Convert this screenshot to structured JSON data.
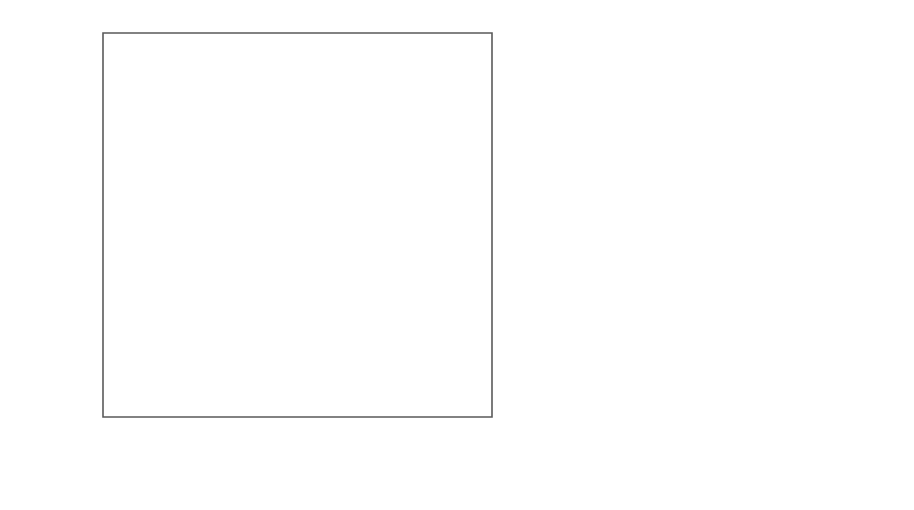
{
  "figure": {
    "width": 914,
    "height": 510,
    "background": "#ffffff"
  },
  "axes": {
    "xlabel": "log(Teff)",
    "xlabel_main": "log(T",
    "xlabel_sub": "eff",
    "xlabel_close": ")",
    "ylabel_main": "log(L/L",
    "ylabel_sub": "⊙",
    "ylabel_close": ")",
    "x_ticks": [
      "3.77",
      "3.76",
      "3.75"
    ],
    "x_tick_values": [
      3.77,
      3.76,
      3.75
    ],
    "y_ticks": [
      "0.2",
      "0.1",
      "0.0",
      "−0.1"
    ],
    "y_tick_values": [
      0.2,
      0.1,
      0.0,
      -0.1
    ],
    "xlim": [
      3.7735,
      3.7465
    ],
    "ylim": [
      -0.152,
      0.2615
    ],
    "x_minor_step": 0.001,
    "y_minor_step": 0.025,
    "grid": false,
    "direction": "x-reversed"
  },
  "panels": [
    {
      "id": "a",
      "tag": "(a)",
      "legend_header": "",
      "legend": [
        {
          "label": "1.40, 0.2667, 5.60",
          "mass": 1.4,
          "y_helium": 0.2667,
          "age": 5.6,
          "style": "solid",
          "color": "#1c1c1c",
          "width": 2.3
        },
        {
          "label": "1.60, 0.2500, 7.32",
          "mass": 1.6,
          "y_helium": 0.25,
          "age": 7.32,
          "style": "dashed",
          "color": "#1c1c1c",
          "width": 2.3
        },
        {
          "label": "1.80, 0.2341, 9.03",
          "mass": 1.8,
          "y_helium": 0.2341,
          "age": 9.03,
          "style": "solid",
          "color": "#9a9a9a",
          "width": 2.0
        },
        {
          "label": "2.00, 0.2198, 10.64",
          "mass": 2.0,
          "y_helium": 0.2198,
          "age": 10.64,
          "style": "dashed",
          "color": "#a8a8a8",
          "width": 2.0
        }
      ],
      "marker": {
        "type": "cross-with-errorbars",
        "x": 3.7642,
        "y": 0.2255
      }
    },
    {
      "id": "b",
      "tag": "(b)",
      "legend_header": "",
      "legend": [
        {
          "label": "1.6616, 0.245, 7.86",
          "mass": 1.6616,
          "y_helium": 0.245,
          "age": 7.86,
          "style": "solid",
          "color": "#1c1c1c",
          "width": 2.3
        },
        {
          "label": "1.4192, 0.265, 5.77",
          "mass": 1.4192,
          "y_helium": 0.265,
          "age": 5.77,
          "style": "dashed",
          "color": "#1c1c1c",
          "width": 2.3
        },
        {
          "label": "1.2036, 0.285, 3.90",
          "mass": 1.2036,
          "y_helium": 0.285,
          "age": 3.9,
          "style": "solid",
          "color": "#9a9a9a",
          "width": 2.0
        },
        {
          "label": "1.0054, 0.305, 2.27",
          "mass": 1.0054,
          "y_helium": 0.305,
          "age": 2.27,
          "style": "dashed",
          "color": "#a8a8a8",
          "width": 2.0
        }
      ],
      "marker": {
        "type": "cross-with-errorbars",
        "x": 3.7642,
        "y": 0.2255
      }
    }
  ],
  "chart_data": {
    "type": "line",
    "title": "",
    "xlabel": "log(Teff)",
    "ylabel": "log(L/Lsun)",
    "xlim": [
      3.7735,
      3.7465
    ],
    "ylim": [
      -0.152,
      0.2615
    ],
    "grid": false,
    "legend_position": "upper-right",
    "panels": [
      {
        "panel": "a",
        "tag": "(a)",
        "legend_format": "mass (Msun), Y (helium), age (Gyr)",
        "observed_point": {
          "log_Teff": 3.7642,
          "log_L": 0.2255,
          "err_log_Teff": 0.0016,
          "err_log_L": 0.009
        },
        "series": [
          {
            "name": "1.40, 0.2667, 5.60",
            "style": "solid",
            "color": "#1c1c1c",
            "points": [
              [
                3.7644,
                0.224
              ],
              [
                3.7646,
                0.218
              ],
              [
                3.7647,
                0.21
              ],
              [
                3.7646,
                0.2
              ],
              [
                3.7644,
                0.188
              ],
              [
                3.764,
                0.174
              ],
              [
                3.7634,
                0.16
              ],
              [
                3.7626,
                0.146
              ],
              [
                3.7616,
                0.132
              ],
              [
                3.7604,
                0.118
              ],
              [
                3.759,
                0.104
              ],
              [
                3.7574,
                0.09
              ],
              [
                3.7556,
                0.076
              ],
              [
                3.7538,
                0.063
              ],
              [
                3.752,
                0.051
              ],
              [
                3.7503,
                0.04
              ],
              [
                3.7487,
                0.03
              ],
              [
                3.7472,
                0.02
              ],
              [
                3.7461,
                0.011
              ],
              [
                3.7452,
                0.002
              ],
              [
                3.7446,
                -0.007
              ],
              [
                3.7443,
                -0.016
              ],
              [
                3.7442,
                -0.024
              ]
            ]
          },
          {
            "name": "1.60, 0.2500, 7.32",
            "style": "dashed",
            "color": "#1c1c1c",
            "points": [
              [
                3.7643,
                0.223
              ],
              [
                3.7645,
                0.216
              ],
              [
                3.7645,
                0.207
              ],
              [
                3.7643,
                0.196
              ],
              [
                3.7638,
                0.184
              ],
              [
                3.7631,
                0.17
              ],
              [
                3.7622,
                0.156
              ],
              [
                3.761,
                0.142
              ],
              [
                3.7596,
                0.128
              ],
              [
                3.758,
                0.114
              ],
              [
                3.7562,
                0.1
              ],
              [
                3.7542,
                0.086
              ],
              [
                3.7522,
                0.072
              ],
              [
                3.7501,
                0.059
              ],
              [
                3.7482,
                0.046
              ],
              [
                3.7473,
                0.033
              ],
              [
                3.7467,
                0.019
              ],
              [
                3.7462,
                0.005
              ],
              [
                3.7459,
                -0.009
              ],
              [
                3.7457,
                -0.023
              ],
              [
                3.7456,
                -0.037
              ],
              [
                3.7455,
                -0.05
              ],
              [
                3.7455,
                -0.063
              ]
            ]
          },
          {
            "name": "1.80, 0.2341, 9.03",
            "style": "solid",
            "color": "#9a9a9a",
            "points": [
              [
                3.7643,
                0.2225
              ],
              [
                3.7644,
                0.215
              ],
              [
                3.7643,
                0.205
              ],
              [
                3.764,
                0.193
              ],
              [
                3.7634,
                0.18
              ],
              [
                3.7626,
                0.166
              ],
              [
                3.7616,
                0.152
              ],
              [
                3.7603,
                0.138
              ],
              [
                3.7588,
                0.124
              ],
              [
                3.7571,
                0.11
              ],
              [
                3.7553,
                0.096
              ],
              [
                3.7534,
                0.082
              ],
              [
                3.7515,
                0.068
              ],
              [
                3.7497,
                0.054
              ],
              [
                3.7482,
                0.04
              ],
              [
                3.7471,
                0.026
              ],
              [
                3.7463,
                0.011
              ],
              [
                3.7457,
                -0.004
              ],
              [
                3.7453,
                -0.019
              ],
              [
                3.7451,
                -0.034
              ],
              [
                3.745,
                -0.049
              ],
              [
                3.745,
                -0.062
              ],
              [
                3.745,
                -0.0655
              ]
            ]
          },
          {
            "name": "2.00, 0.2198, 10.64",
            "style": "dashed",
            "color": "#a8a8a8",
            "points": [
              [
                3.7642,
                0.222
              ],
              [
                3.7643,
                0.214
              ],
              [
                3.7642,
                0.203
              ],
              [
                3.7638,
                0.19
              ],
              [
                3.7631,
                0.176
              ],
              [
                3.7621,
                0.162
              ],
              [
                3.7609,
                0.148
              ],
              [
                3.7594,
                0.134
              ],
              [
                3.7577,
                0.12
              ],
              [
                3.7559,
                0.106
              ],
              [
                3.754,
                0.092
              ],
              [
                3.7521,
                0.078
              ],
              [
                3.7503,
                0.064
              ],
              [
                3.7486,
                0.049
              ],
              [
                3.7472,
                0.034
              ],
              [
                3.7461,
                0.018
              ],
              [
                3.7453,
                0.001
              ],
              [
                3.7448,
                -0.017
              ],
              [
                3.7445,
                -0.036
              ],
              [
                3.7443,
                -0.056
              ],
              [
                3.7442,
                -0.076
              ],
              [
                3.7442,
                -0.097
              ],
              [
                3.7442,
                -0.118
              ],
              [
                3.7443,
                -0.138
              ]
            ]
          }
        ]
      },
      {
        "panel": "b",
        "tag": "(b)",
        "legend_format": "mass (Msun), Y (helium), age (Gyr)",
        "observed_point": {
          "log_Teff": 3.7642,
          "log_L": 0.2255,
          "err_log_Teff": 0.0016,
          "err_log_L": 0.009
        },
        "series": [
          {
            "name": "1.6616, 0.245, 7.86",
            "style": "solid",
            "color": "#1c1c1c",
            "points": [
              [
                3.7644,
                0.224
              ],
              [
                3.7648,
                0.217
              ],
              [
                3.765,
                0.208
              ],
              [
                3.765,
                0.196
              ],
              [
                3.7648,
                0.183
              ],
              [
                3.7644,
                0.169
              ],
              [
                3.7638,
                0.155
              ],
              [
                3.763,
                0.141
              ],
              [
                3.762,
                0.127
              ],
              [
                3.7608,
                0.113
              ],
              [
                3.7595,
                0.099
              ],
              [
                3.758,
                0.085
              ],
              [
                3.7564,
                0.071
              ],
              [
                3.7548,
                0.058
              ],
              [
                3.7531,
                0.045
              ],
              [
                3.7514,
                0.033
              ],
              [
                3.7497,
                0.021
              ],
              [
                3.7482,
                0.01
              ],
              [
                3.7468,
                0.0
              ],
              [
                3.7456,
                -0.01
              ],
              [
                3.7446,
                -0.02
              ],
              [
                3.7438,
                -0.03
              ],
              [
                3.7432,
                -0.039
              ],
              [
                3.7428,
                -0.046
              ]
            ]
          },
          {
            "name": "1.4192, 0.265, 5.77",
            "style": "dashed",
            "color": "#1c1c1c",
            "points": [
              [
                3.7643,
                0.2245
              ],
              [
                3.7645,
                0.218
              ],
              [
                3.7646,
                0.21
              ],
              [
                3.7645,
                0.199
              ],
              [
                3.7641,
                0.186
              ],
              [
                3.7635,
                0.172
              ],
              [
                3.7627,
                0.158
              ],
              [
                3.7617,
                0.144
              ],
              [
                3.7605,
                0.13
              ],
              [
                3.7592,
                0.116
              ],
              [
                3.7577,
                0.102
              ],
              [
                3.7561,
                0.088
              ],
              [
                3.7545,
                0.075
              ],
              [
                3.7528,
                0.062
              ],
              [
                3.7511,
                0.05
              ],
              [
                3.7494,
                0.038
              ],
              [
                3.7478,
                0.027
              ],
              [
                3.7463,
                0.016
              ],
              [
                3.7452,
                0.006
              ],
              [
                3.7445,
                -0.002
              ],
              [
                3.7442,
                -0.008
              ]
            ]
          },
          {
            "name": "1.2036, 0.285, 3.90",
            "style": "solid",
            "color": "#9a9a9a",
            "points": [
              [
                3.7641,
                0.225
              ],
              [
                3.7639,
                0.219
              ],
              [
                3.7634,
                0.211
              ],
              [
                3.7628,
                0.201
              ],
              [
                3.762,
                0.189
              ],
              [
                3.761,
                0.176
              ],
              [
                3.7598,
                0.162
              ],
              [
                3.7585,
                0.148
              ],
              [
                3.7571,
                0.134
              ],
              [
                3.7556,
                0.12
              ],
              [
                3.7541,
                0.107
              ],
              [
                3.7526,
                0.095
              ],
              [
                3.7512,
                0.083
              ],
              [
                3.7499,
                0.072
              ],
              [
                3.7487,
                0.062
              ],
              [
                3.7477,
                0.054
              ],
              [
                3.747,
                0.049
              ]
            ]
          },
          {
            "name": "1.0054, 0.305, 2.27",
            "style": "dashed",
            "color": "#a8a8a8",
            "points": [
              [
                3.764,
                0.2255
              ],
              [
                3.7634,
                0.2215
              ],
              [
                3.7626,
                0.216
              ],
              [
                3.7616,
                0.208
              ],
              [
                3.7604,
                0.198
              ],
              [
                3.759,
                0.187
              ],
              [
                3.7576,
                0.175
              ],
              [
                3.7561,
                0.163
              ],
              [
                3.7546,
                0.151
              ],
              [
                3.7532,
                0.14
              ],
              [
                3.7518,
                0.13
              ],
              [
                3.7506,
                0.121
              ],
              [
                3.7496,
                0.114
              ],
              [
                3.7488,
                0.109
              ],
              [
                3.7483,
                0.106
              ]
            ]
          }
        ]
      }
    ]
  }
}
